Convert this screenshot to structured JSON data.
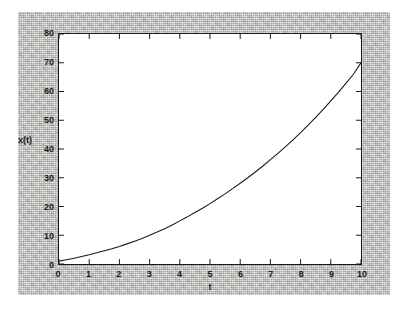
{
  "figure": {
    "background_color": "#b9b9b7",
    "plot_background_color": "#ffffff",
    "frame_color": "#1a1a1a",
    "curve_color": "#1a1a1a"
  },
  "chart_data": {
    "type": "line",
    "title": "",
    "subtitle": "",
    "xlabel": "t",
    "ylabel": "x(t)",
    "xlim": [
      0,
      10
    ],
    "ylim": [
      0,
      80
    ],
    "grid": false,
    "legend": false,
    "legend_position": "none",
    "x_ticks": [
      0,
      1,
      2,
      3,
      4,
      5,
      6,
      7,
      8,
      9,
      10
    ],
    "x_tick_labels": [
      "0",
      "1",
      "2",
      "3",
      "4",
      "5",
      "6",
      "7",
      "8",
      "9",
      "10"
    ],
    "y_ticks": [
      0,
      10,
      20,
      30,
      40,
      50,
      60,
      70,
      80
    ],
    "y_tick_labels": [
      "0",
      "10",
      "20",
      "30",
      "40",
      "50",
      "60",
      "70",
      "80"
    ],
    "tick_direction": "in",
    "series": [
      {
        "name": "x(t)",
        "line_style": "solid",
        "line_width": 1,
        "color": "#1a1a1a",
        "x": [
          0,
          0.25,
          0.5,
          0.75,
          1,
          1.25,
          1.5,
          1.75,
          2,
          2.25,
          2.5,
          2.75,
          3,
          3.25,
          3.5,
          3.75,
          4,
          4.25,
          4.5,
          4.75,
          5,
          5.25,
          5.5,
          5.75,
          6,
          6.25,
          6.5,
          6.75,
          7,
          7.25,
          7.5,
          7.75,
          8,
          8.25,
          8.5,
          8.75,
          9,
          9.25,
          9.5,
          9.75,
          10
        ],
        "y": [
          1.0,
          1.5,
          2.0,
          2.6,
          3.2,
          3.9,
          4.6,
          5.3,
          6.1,
          7.0,
          7.9,
          8.9,
          10.0,
          11.1,
          12.3,
          13.6,
          15.0,
          16.4,
          17.9,
          19.4,
          21.0,
          22.7,
          24.4,
          26.2,
          28.1,
          30.0,
          32.0,
          34.1,
          36.3,
          38.5,
          40.8,
          43.2,
          45.7,
          48.3,
          51.0,
          53.8,
          56.7,
          59.7,
          62.8,
          66.0,
          70.0
        ]
      }
    ],
    "annotations": []
  },
  "axis_labels": {
    "y_title": "x(t)",
    "x_title": "t"
  }
}
